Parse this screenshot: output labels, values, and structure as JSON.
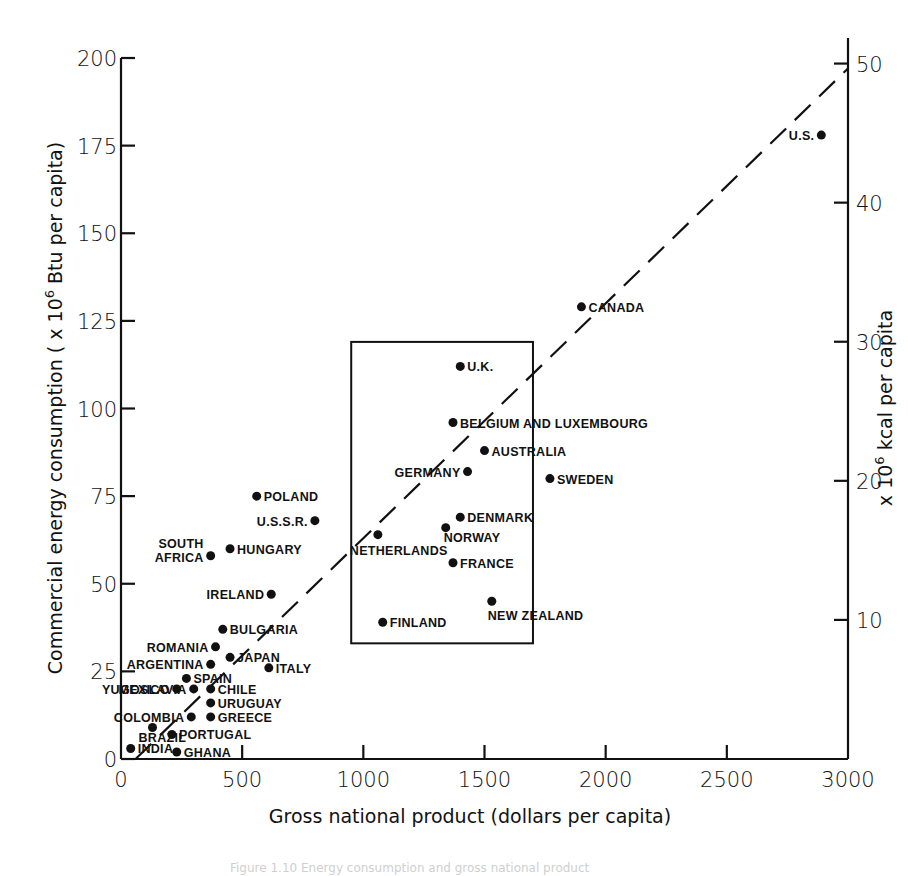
{
  "chart_data": {
    "type": "scatter",
    "title": "",
    "xlabel": "Gross national product (dollars per capita)",
    "ylabel": "Commercial energy consumption (x 10^6 Btu per capita)",
    "ylabel_parts": {
      "pre": "Commercial energy consumption ( x 10",
      "sup": "6",
      "post": " Btu per capita)"
    },
    "y2label": "x 10^6 kcal per capita",
    "y2label_parts": {
      "pre": "x 10",
      "sup": "6",
      "post": " kcal per capita"
    },
    "xlim": [
      0,
      3000
    ],
    "ylim": [
      0,
      200
    ],
    "y2lim": [
      0,
      50
    ],
    "x_ticks": [
      0,
      500,
      1000,
      1500,
      2000,
      2500,
      3000
    ],
    "y_ticks": [
      0,
      25,
      50,
      75,
      100,
      125,
      150,
      175,
      200
    ],
    "y2_ticks": [
      10,
      20,
      30,
      40,
      50
    ],
    "grid": false,
    "legend": null,
    "trend_line": {
      "style": "dashed",
      "from": [
        60,
        0
      ],
      "to": [
        3000,
        197
      ]
    },
    "highlight_box": {
      "x0": 950,
      "x1": 1700,
      "y0": 33,
      "y1": 119
    },
    "points": [
      {
        "label": "U.S.",
        "x": 2890,
        "y": 178
      },
      {
        "label": "CANADA",
        "x": 1900,
        "y": 129
      },
      {
        "label": "U.K.",
        "x": 1400,
        "y": 112
      },
      {
        "label": "BELGIUM AND LUXEMBOURG",
        "x": 1370,
        "y": 96
      },
      {
        "label": "AUSTRALIA",
        "x": 1500,
        "y": 88
      },
      {
        "label": "GERMANY",
        "x": 1430,
        "y": 82
      },
      {
        "label": "SWEDEN",
        "x": 1770,
        "y": 80
      },
      {
        "label": "DENMARK",
        "x": 1400,
        "y": 69
      },
      {
        "label": "NORWAY",
        "x": 1340,
        "y": 66
      },
      {
        "label": "NETHERLANDS",
        "x": 1060,
        "y": 64
      },
      {
        "label": "FRANCE",
        "x": 1370,
        "y": 56
      },
      {
        "label": "NEW ZEALAND",
        "x": 1530,
        "y": 45
      },
      {
        "label": "FINLAND",
        "x": 1080,
        "y": 39
      },
      {
        "label": "POLAND",
        "x": 560,
        "y": 75
      },
      {
        "label": "U.S.S.R.",
        "x": 800,
        "y": 68
      },
      {
        "label": "HUNGARY",
        "x": 450,
        "y": 60
      },
      {
        "label": "SOUTH AFRICA",
        "x": 370,
        "y": 58
      },
      {
        "label": "IRELAND",
        "x": 620,
        "y": 47
      },
      {
        "label": "BULGARIA",
        "x": 420,
        "y": 37
      },
      {
        "label": "ROMANIA",
        "x": 390,
        "y": 32
      },
      {
        "label": "ARGENTINA",
        "x": 370,
        "y": 27
      },
      {
        "label": "JAPAN",
        "x": 450,
        "y": 29
      },
      {
        "label": "ITALY",
        "x": 610,
        "y": 26
      },
      {
        "label": "SPAIN",
        "x": 270,
        "y": 23
      },
      {
        "label": "MEXICO",
        "x": 230,
        "y": 20
      },
      {
        "label": "CHILE",
        "x": 370,
        "y": 20
      },
      {
        "label": "YUGOSLAVIA",
        "x": 300,
        "y": 20
      },
      {
        "label": "URUGUAY",
        "x": 370,
        "y": 16
      },
      {
        "label": "COLOMBIA",
        "x": 290,
        "y": 12
      },
      {
        "label": "GREECE",
        "x": 370,
        "y": 12
      },
      {
        "label": "BRAZIL",
        "x": 130,
        "y": 9
      },
      {
        "label": "PORTUGAL",
        "x": 210,
        "y": 7
      },
      {
        "label": "INDIA",
        "x": 40,
        "y": 3
      },
      {
        "label": "GHANA",
        "x": 230,
        "y": 2
      }
    ]
  },
  "caption": "Figure 1.10   Energy consumption and gross national product"
}
